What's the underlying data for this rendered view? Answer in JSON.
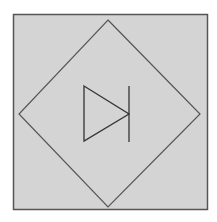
{
  "diagram": {
    "colors": {
      "background": "#ffffff",
      "panel_fill": "#d4d4d4",
      "panel_border": "#555555",
      "line": "#444444"
    },
    "shapes": {
      "panel": "square-panel",
      "frame": "diamond",
      "symbol": "diode"
    }
  }
}
